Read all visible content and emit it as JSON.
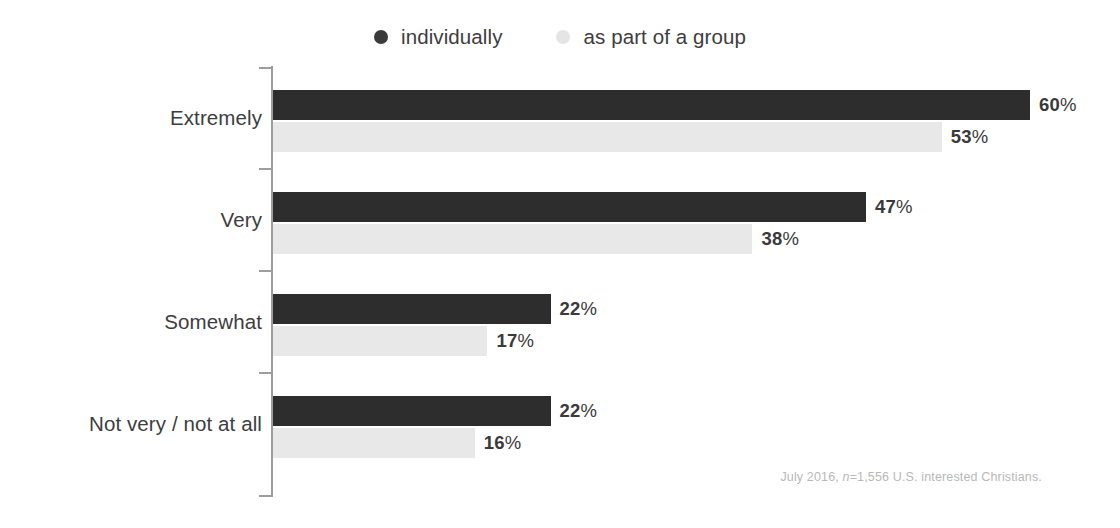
{
  "legend": {
    "items": [
      {
        "label": "individually",
        "color": "#3a3a3a",
        "icon": "legend-dot-icon"
      },
      {
        "label": "as part of a group",
        "color": "#e5e5e5",
        "icon": "legend-dot-icon"
      }
    ]
  },
  "footnote": {
    "prefix": "July 2016, ",
    "italic": "n",
    "suffix": "=1,556 U.S. interested Christians.",
    "full": "July 2016, n=1,556 U.S. interested Christians."
  },
  "chart_data": {
    "type": "bar",
    "orientation": "horizontal",
    "title": "",
    "subtitle": "",
    "xlabel": "",
    "ylabel": "",
    "xlim": [
      0,
      60
    ],
    "grid": false,
    "legend_position": "top-center",
    "categories": [
      "Extremely",
      "Very",
      "Somewhat",
      "Not very / not at all"
    ],
    "series": [
      {
        "name": "individually",
        "color": "#2d2d2d",
        "values": [
          60,
          47,
          22,
          22
        ],
        "labels": [
          "60%",
          "47%",
          "22%",
          "22%"
        ]
      },
      {
        "name": "as part of a group",
        "color": "#e8e8e8",
        "values": [
          53,
          38,
          17,
          16
        ],
        "labels": [
          "53%",
          "38%",
          "17%",
          "16%"
        ]
      }
    ],
    "annotations": [
      "July 2016, n=1,556 U.S. interested Christians."
    ]
  }
}
